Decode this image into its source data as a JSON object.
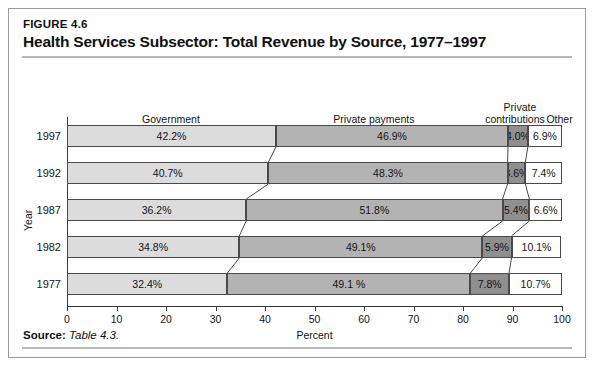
{
  "figure": {
    "number": "FIGURE 4.6",
    "title": "Health Services Subsector: Total Revenue by Source, 1977–1997",
    "source_label": "Source:",
    "source_value": "Table 4.3."
  },
  "chart_data": {
    "type": "bar",
    "orientation": "horizontal",
    "stacked": true,
    "title": "Health Services Subsector: Total Revenue by Source, 1977–1997",
    "xlabel": "Percent",
    "ylabel": "Year",
    "xlim": [
      0,
      100
    ],
    "xticks": [
      "0",
      "10",
      "20",
      "30",
      "40",
      "50",
      "60",
      "70",
      "80",
      "90",
      "100"
    ],
    "grid": false,
    "legend_position": "top-inline-column-headers",
    "categories": [
      "1997",
      "1992",
      "1987",
      "1982",
      "1977"
    ],
    "series": [
      {
        "name": "Government",
        "color": "#dcdcdc",
        "values": [
          42.2,
          40.7,
          36.2,
          34.8,
          32.4
        ],
        "labels": [
          "42.2%",
          "40.7%",
          "36.2%",
          "34.8%",
          "32.4%"
        ]
      },
      {
        "name": "Private payments",
        "color": "#b3b3b3",
        "values": [
          46.9,
          48.3,
          51.8,
          49.1,
          49.1
        ],
        "labels": [
          "46.9%",
          "48.3%",
          "51.8%",
          "49.1%",
          "49.1 %"
        ]
      },
      {
        "name": "Private contributions",
        "color": "#8f8f8f",
        "values": [
          4.0,
          3.6,
          5.4,
          5.9,
          7.8
        ],
        "labels": [
          "4.0%",
          "3.6%",
          "5.4%",
          "5.9%",
          "7.8%"
        ]
      },
      {
        "name": "Other",
        "color": "#ffffff",
        "values": [
          6.9,
          7.4,
          6.6,
          10.1,
          10.7
        ],
        "labels": [
          "6.9%",
          "7.4%",
          "6.6%",
          "10.1%",
          "10.7%"
        ]
      }
    ],
    "column_headers": [
      {
        "text": "Government",
        "center_pct": 21
      },
      {
        "text": "Private payments",
        "center_pct": 62
      },
      {
        "text": "Private",
        "center_pct": 91.5
      },
      {
        "text": "contributions",
        "center_pct": 90.5
      },
      {
        "text": "Other",
        "center_pct": 99.5
      }
    ]
  }
}
